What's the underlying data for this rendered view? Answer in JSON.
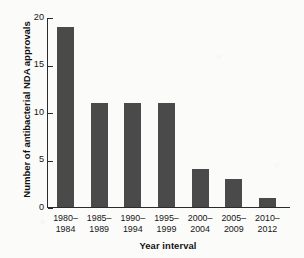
{
  "figure": {
    "caption_sliver": "concern in the United States"
  },
  "chart_data": {
    "type": "bar",
    "title": "",
    "xlabel": "Year interval",
    "ylabel": "Number of antibacterial NDA approvals",
    "categories": [
      "1980–\n1984",
      "1985–\n1989",
      "1990–\n1994",
      "1995–\n1999",
      "2000–\n2004",
      "2005–\n2009",
      "2010–\n2012"
    ],
    "category_lines": [
      [
        "1980–",
        "1984"
      ],
      [
        "1985–",
        "1989"
      ],
      [
        "1990–",
        "1994"
      ],
      [
        "1995–",
        "1999"
      ],
      [
        "2000–",
        "2004"
      ],
      [
        "2005–",
        "2009"
      ],
      [
        "2010–",
        "2012"
      ]
    ],
    "values": [
      19,
      11,
      11,
      11,
      4,
      3,
      1
    ],
    "ylim": [
      0,
      20
    ],
    "yticks": [
      0,
      5,
      10,
      15,
      20
    ],
    "ytick_labels": [
      "0",
      "5",
      "10",
      "15",
      "20"
    ],
    "grid": false,
    "legend": false,
    "bar_color": "#4a4a4a",
    "axis_color": "#2b2b2b"
  }
}
